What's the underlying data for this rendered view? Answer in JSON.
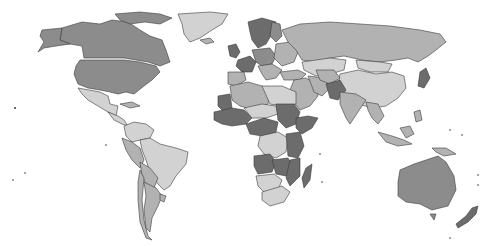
{
  "map": {
    "type": "choropleth",
    "projection": "world",
    "colors": {
      "dark": "#6c6c6c",
      "mid": "#8c8c8c",
      "light_mid": "#b2b2b2",
      "light": "#d2d2d2",
      "border": "#3a3a3a",
      "ocean": "#ffffff"
    },
    "regions": [
      {
        "name": "Canada",
        "shade": "mid",
        "d": "M62,28 L82,22 L100,24 L112,20 L128,22 L140,30 L150,36 L162,40 L166,50 L170,62 L160,66 L148,62 L136,60 L124,58 L100,58 L84,58 L82,46 L70,44 L60,40 Z"
      },
      {
        "name": "Alaska",
        "shade": "mid",
        "d": "M42,30 L62,28 L60,40 L70,44 L56,46 L44,48 L38,52 L44,42 L40,36 Z"
      },
      {
        "name": "Arctic Islands",
        "shade": "mid",
        "d": "M115,14 L140,12 L160,14 L172,18 L160,24 L145,22 L130,24 L120,20 Z"
      },
      {
        "name": "Greenland",
        "shade": "light",
        "d": "M178,14 L210,12 L228,14 L222,24 L212,30 L200,38 L190,42 L184,34 L182,24 Z"
      },
      {
        "name": "United States",
        "shade": "mid",
        "d": "M80,60 L124,60 L140,62 L156,66 L160,72 L152,80 L144,86 L134,94 L126,92 L118,94 L110,92 L100,90 L88,88 L78,84 L74,74 L76,66 Z"
      },
      {
        "name": "Mexico",
        "shade": "light",
        "d": "M78,88 L100,92 L108,96 L110,104 L118,106 L116,116 L108,112 L98,106 L88,100 L82,94 Z"
      },
      {
        "name": "Central America",
        "shade": "light",
        "d": "M108,112 L118,116 L124,120 L128,126 L122,124 L114,120 Z"
      },
      {
        "name": "Cuba/Caribbean",
        "shade": "light_mid",
        "d": "M120,104 L132,102 L140,106 L130,108 Z"
      },
      {
        "name": "Colombia/Venezuela",
        "shade": "light",
        "d": "M124,126 L134,122 L146,124 L154,130 L150,138 L140,140 L132,142 L126,136 Z"
      },
      {
        "name": "Peru/Ecuador",
        "shade": "light_mid",
        "d": "M122,138 L132,142 L140,148 L144,160 L140,168 L132,160 L126,150 Z"
      },
      {
        "name": "Brazil",
        "shade": "light",
        "d": "M140,140 L150,138 L160,144 L176,148 L188,152 L186,164 L176,176 L170,186 L164,190 L158,184 L150,172 L146,160 L142,150 Z"
      },
      {
        "name": "Bolivia/Paraguay",
        "shade": "light_mid",
        "d": "M140,162 L150,168 L158,178 L154,188 L146,184 L142,176 Z"
      },
      {
        "name": "Chile",
        "shade": "light_mid",
        "d": "M140,170 L144,178 L142,200 L144,220 L148,236 L152,240 L146,238 L140,222 L138,200 L138,182 Z"
      },
      {
        "name": "Argentina",
        "shade": "light_mid",
        "d": "M144,182 L156,188 L162,196 L158,206 L152,218 L150,232 L146,228 L144,210 L146,196 Z"
      },
      {
        "name": "Uruguay",
        "shade": "light_mid",
        "d": "M160,194 L166,196 L164,202 L160,200 Z"
      },
      {
        "name": "Iceland",
        "shade": "light_mid",
        "d": "M200,40 L210,38 L214,42 L206,44 Z"
      },
      {
        "name": "UK/Ireland",
        "shade": "dark",
        "d": "M228,46 L236,44 L240,52 L236,58 L230,56 Z"
      },
      {
        "name": "Scandinavia",
        "shade": "dark",
        "d": "M248,22 L262,18 L276,22 L272,34 L266,44 L258,48 L252,40 L250,32 Z"
      },
      {
        "name": "Finland",
        "shade": "mid",
        "d": "M272,22 L280,24 L282,36 L276,42 L270,36 Z"
      },
      {
        "name": "France",
        "shade": "dark",
        "d": "M238,60 L250,56 L256,62 L252,72 L242,72 L236,66 Z"
      },
      {
        "name": "Spain/Portugal",
        "shade": "light_mid",
        "d": "M228,72 L244,72 L246,80 L236,86 L228,84 Z"
      },
      {
        "name": "Central Europe",
        "shade": "mid",
        "d": "M252,50 L270,48 L276,56 L272,64 L262,66 L256,62 Z"
      },
      {
        "name": "Italy/Balkans",
        "shade": "light_mid",
        "d": "M258,66 L272,64 L282,70 L276,78 L266,80 L262,74 Z"
      },
      {
        "name": "Eastern Europe",
        "shade": "light_mid",
        "d": "M276,44 L290,42 L298,52 L294,62 L282,66 L274,58 Z"
      },
      {
        "name": "Russia",
        "shade": "light_mid",
        "d": "M282,30 L300,24 L330,22 L360,24 L390,26 L420,30 L440,34 L446,42 L436,50 L428,56 L418,62 L408,58 L396,60 L380,62 L362,60 L344,56 L330,58 L316,62 L302,60 L296,50 L288,42 Z"
      },
      {
        "name": "Kazakhstan",
        "shade": "light",
        "d": "M302,62 L330,58 L346,60 L344,70 L330,74 L316,76 L304,70 Z"
      },
      {
        "name": "Mongolia",
        "shade": "light",
        "d": "M356,60 L380,62 L392,64 L388,72 L370,72 L358,68 Z"
      },
      {
        "name": "China",
        "shade": "light",
        "d": "M340,74 L358,70 L376,74 L392,72 L404,76 L406,88 L398,98 L386,106 L372,108 L358,104 L346,96 L338,86 Z"
      },
      {
        "name": "Japan",
        "shade": "dark",
        "d": "M420,72 L426,68 L430,78 L424,88 L418,86 Z"
      },
      {
        "name": "Turkey",
        "shade": "light_mid",
        "d": "M280,72 L298,70 L306,74 L300,80 L284,80 Z"
      },
      {
        "name": "Middle East",
        "shade": "light_mid",
        "d": "M294,80 L306,78 L316,84 L318,96 L310,106 L300,110 L292,100 L290,90 Z"
      },
      {
        "name": "Iran",
        "shade": "light_mid",
        "d": "M308,76 L324,78 L330,88 L322,96 L314,92 Z"
      },
      {
        "name": "Central Asia",
        "shade": "light_mid",
        "d": "M316,70 L334,70 L340,78 L330,84 L320,80 Z"
      },
      {
        "name": "Pakistan/Afghanistan",
        "shade": "dark",
        "d": "M326,84 L340,80 L346,90 L338,100 L330,98 Z"
      },
      {
        "name": "India",
        "shade": "light_mid",
        "d": "M340,92 L356,94 L366,100 L358,112 L350,124 L346,118 L340,104 Z"
      },
      {
        "name": "Southeast Asia",
        "shade": "light_mid",
        "d": "M366,102 L378,104 L384,116 L378,124 L372,118 L368,110 Z"
      },
      {
        "name": "Indonesia",
        "shade": "light_mid",
        "d": "M378,132 L392,136 L404,140 L412,144 L398,146 L386,142 Z"
      },
      {
        "name": "Borneo",
        "shade": "light_mid",
        "d": "M400,128 L410,126 L414,134 L406,138 Z"
      },
      {
        "name": "Papua New Guinea",
        "shade": "light_mid",
        "d": "M432,148 L446,148 L456,154 L444,156 L436,152 Z"
      },
      {
        "name": "Philippines",
        "shade": "light_mid",
        "d": "M414,112 L420,110 L422,120 L416,122 Z"
      },
      {
        "name": "Australia",
        "shade": "mid",
        "d": "M400,170 L414,164 L426,160 L438,156 L446,162 L454,176 L456,190 L448,206 L432,210 L420,204 L406,202 L398,196 L398,182 Z"
      },
      {
        "name": "Tasmania",
        "shade": "mid",
        "d": "M430,214 L436,214 L434,220 Z"
      },
      {
        "name": "New Zealand",
        "shade": "dark",
        "d": "M472,208 L478,206 L476,214 L468,222 L458,228 L456,224 L466,216 Z"
      },
      {
        "name": "North Africa West",
        "shade": "light_mid",
        "d": "M230,86 L248,82 L262,86 L270,92 L268,104 L254,110 L240,106 L232,100 Z"
      },
      {
        "name": "Western Sahara/Mauritania",
        "shade": "dark",
        "d": "M218,96 L230,94 L232,108 L224,112 L218,106 Z"
      },
      {
        "name": "Libya/Egypt",
        "shade": "light",
        "d": "M262,86 L282,86 L296,92 L296,104 L284,106 L270,104 Z"
      },
      {
        "name": "West Africa",
        "shade": "dark",
        "d": "M214,112 L232,108 L244,110 L252,118 L246,124 L232,126 L222,124 L214,120 Z"
      },
      {
        "name": "Sahel",
        "shade": "light",
        "d": "M244,108 L262,104 L276,106 L278,114 L266,118 L252,118 Z"
      },
      {
        "name": "Sudan",
        "shade": "dark",
        "d": "M276,104 L294,104 L300,112 L296,124 L286,128 L278,120 Z"
      },
      {
        "name": "Ethiopia/Horn",
        "shade": "dark",
        "d": "M296,118 L308,116 L318,118 L312,128 L302,134 L296,128 Z"
      },
      {
        "name": "Central Africa",
        "shade": "dark",
        "d": "M246,124 L264,118 L278,122 L276,132 L262,136 L250,134 Z"
      },
      {
        "name": "DR Congo",
        "shade": "light",
        "d": "M260,136 L278,132 L288,138 L286,152 L276,158 L264,154 L258,146 Z"
      },
      {
        "name": "East Africa",
        "shade": "dark",
        "d": "M286,134 L300,132 L304,146 L298,158 L288,156 Z"
      },
      {
        "name": "Angola",
        "shade": "dark",
        "d": "M254,156 L270,154 L276,162 L272,172 L258,174 L254,166 Z"
      },
      {
        "name": "Zambia/Zimbabwe",
        "shade": "dark",
        "d": "M272,160 L288,158 L294,168 L286,176 L276,174 Z"
      },
      {
        "name": "Mozambique",
        "shade": "dark",
        "d": "M290,160 L300,158 L300,176 L290,186 L286,178 Z"
      },
      {
        "name": "Namibia/Botswana",
        "shade": "light",
        "d": "M256,176 L274,174 L282,180 L278,190 L264,192 L258,186 Z"
      },
      {
        "name": "South Africa",
        "shade": "light",
        "d": "M262,192 L282,186 L290,192 L284,202 L270,206 L262,200 Z"
      },
      {
        "name": "Madagascar",
        "shade": "dark",
        "d": "M306,168 L312,164 L310,180 L304,188 L302,178 Z"
      }
    ]
  }
}
